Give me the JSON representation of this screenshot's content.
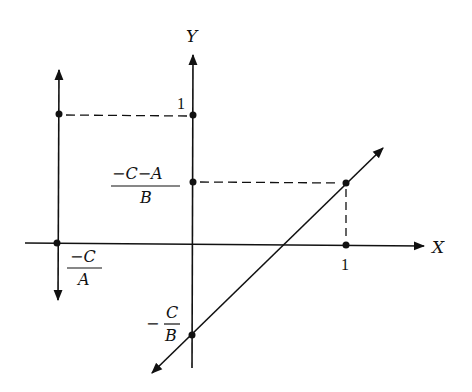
{
  "diagram": {
    "axes": {
      "x_label": "X",
      "y_label": "Y"
    },
    "ticks": {
      "x_one": "1",
      "y_one": "1"
    },
    "labels": {
      "y_point_numerator": "−C−A",
      "y_point_denominator": "B",
      "y_intercept_sign": "−",
      "y_intercept_numerator": "C",
      "y_intercept_denominator": "B",
      "x_intercept_numerator": "−C",
      "x_intercept_denominator": "A"
    },
    "colors": {
      "ink": "#111111",
      "background": "#ffffff"
    }
  }
}
